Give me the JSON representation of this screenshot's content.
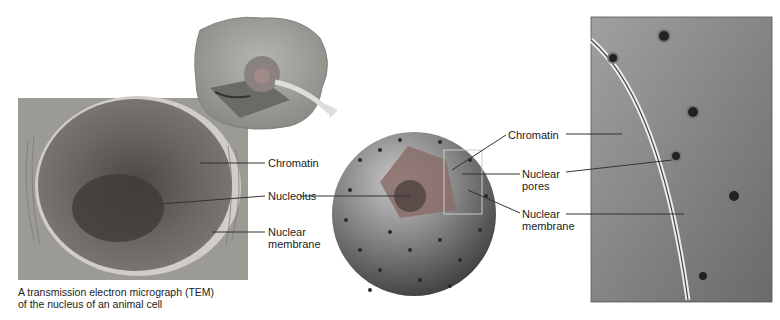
{
  "figure": {
    "panels": [
      {
        "id": "tem",
        "description": "TEM micrograph of nucleus"
      },
      {
        "id": "cell-cutaway",
        "description": "3D cutaway animal cell"
      },
      {
        "id": "nucleus-sphere",
        "description": "3D nucleus with pores"
      },
      {
        "id": "membrane-detail",
        "description": "close-up of nuclear envelope and pores"
      }
    ],
    "tem_labels": {
      "chromatin": "Chromatin",
      "nucleolus": "Nucleolus",
      "nuclear_membrane_1": "Nuclear",
      "nuclear_membrane_2": "membrane"
    },
    "sphere_labels": {
      "chromatin": "Chromatin",
      "pores_1": "Nuclear",
      "pores_2": "pores",
      "membrane_1": "Nuclear",
      "membrane_2": "membrane"
    },
    "caption": {
      "line1": "A transmission electron micrograph (TEM)",
      "line2": "of the nucleus of an animal cell"
    },
    "colors": {
      "tem_bg": "#9a9a92",
      "tem_nucleus": "#6e6a66",
      "sphere": "#7a7a7a",
      "detail_bg": "#8c8c8c",
      "leader": "#333333"
    }
  }
}
